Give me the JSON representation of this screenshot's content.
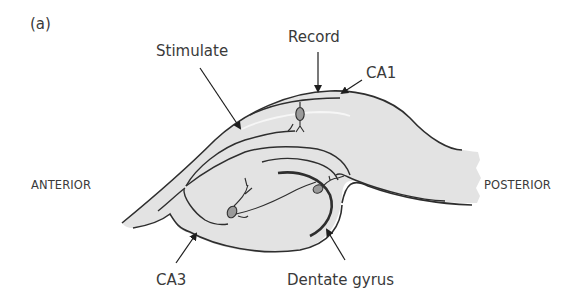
{
  "figure": {
    "panel_label": "(a)",
    "colors": {
      "tissue_fill": "#e3e3e3",
      "outline": "#2e2e2e",
      "cell_fill": "#9a9a9a",
      "highlight_line": "#f4f4f4",
      "text": "#3a3a3a"
    },
    "labels": {
      "stimulate": "Stimulate",
      "record": "Record",
      "ca1": "CA1",
      "ca3": "CA3",
      "dentate_gyrus": "Dentate gyrus",
      "anterior": "ANTERIOR",
      "posterior": "POSTERIOR"
    }
  }
}
